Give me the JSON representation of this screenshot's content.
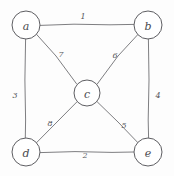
{
  "diagram": {
    "style": "hand-drawn pencil sketch",
    "colors": {
      "background": "#fdfdfd",
      "stroke": "#6f6f73",
      "node_stroke": "#5e5e62",
      "node_fill": "#ffffff",
      "label": "#4a4a4e"
    },
    "nodes": [
      {
        "id": "a",
        "label": "a",
        "cx": 26,
        "cy": 25,
        "r": 14
      },
      {
        "id": "b",
        "label": "b",
        "cx": 148,
        "cy": 25,
        "r": 14
      },
      {
        "id": "c",
        "label": "c",
        "cx": 87,
        "cy": 93,
        "r": 13
      },
      {
        "id": "d",
        "label": "d",
        "cx": 26,
        "cy": 152,
        "r": 14
      },
      {
        "id": "e",
        "label": "e",
        "cx": 148,
        "cy": 152,
        "r": 14
      }
    ],
    "edges": [
      {
        "id": "a-b",
        "from": "a",
        "to": "b",
        "weight": "1",
        "lx": 83,
        "ly": 16
      },
      {
        "id": "d-e",
        "from": "d",
        "to": "e",
        "weight": "2",
        "lx": 85,
        "ly": 155
      },
      {
        "id": "a-d",
        "from": "a",
        "to": "d",
        "weight": "3",
        "lx": 15,
        "ly": 95
      },
      {
        "id": "b-e",
        "from": "b",
        "to": "e",
        "weight": "4",
        "lx": 158,
        "ly": 95
      },
      {
        "id": "c-e",
        "from": "c",
        "to": "e",
        "weight": "5",
        "lx": 124,
        "ly": 125
      },
      {
        "id": "b-c",
        "from": "b",
        "to": "c",
        "weight": "6",
        "lx": 115,
        "ly": 55
      },
      {
        "id": "a-c",
        "from": "a",
        "to": "c",
        "weight": "7",
        "lx": 61,
        "ly": 54
      },
      {
        "id": "c-d",
        "from": "c",
        "to": "d",
        "weight": "8",
        "lx": 50,
        "ly": 123
      }
    ]
  }
}
